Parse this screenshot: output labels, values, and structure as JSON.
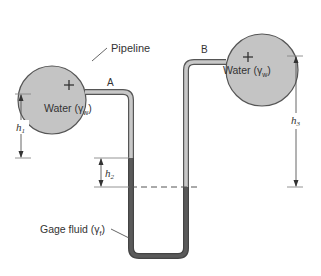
{
  "diagram": {
    "pipeline_label": "Pipeline",
    "left_vessel": {
      "fluid_label": "Water (γ",
      "fluid_sub": "w",
      "fluid_close": ")",
      "point_label": "A"
    },
    "right_vessel": {
      "fluid_label": "Water (γ",
      "fluid_sub": "w",
      "fluid_close": ")",
      "point_label": "B"
    },
    "gage_fluid": {
      "label": "Gage fluid (γ",
      "sub": "f",
      "close": ")"
    },
    "dimensions": {
      "h1": {
        "symbol": "h",
        "sub": "1"
      },
      "h2": {
        "symbol": "h",
        "sub": "2"
      },
      "h3": {
        "symbol": "h",
        "sub": "3"
      }
    },
    "colors": {
      "vessel_fill": "#c4c4c4",
      "water_tube": "#c8c8c8",
      "gage_fluid": "#5a5a5a",
      "outline": "#555555"
    }
  }
}
